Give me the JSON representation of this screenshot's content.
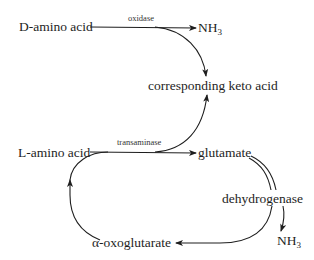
{
  "diagram": {
    "nodes": {
      "d_amino_acid": {
        "prefix": "D",
        "text": "-amino acid"
      },
      "nh3_top": {
        "base": "NH",
        "sub": "3"
      },
      "keto_acid": {
        "text": "corresponding keto acid"
      },
      "l_amino_acid": {
        "prefix": "L",
        "text": "-amino acid"
      },
      "glutamate": {
        "text": "glutamate"
      },
      "dehydrogenase": {
        "text": "dehydrogenase"
      },
      "nh3_bottom": {
        "base": "NH",
        "sub": "3"
      },
      "oxoglutarate": {
        "text": "α-oxoglutarate"
      }
    },
    "enzymes": {
      "oxidase": "oxidase",
      "transaminase": "transaminase"
    },
    "edges": [
      {
        "from": "D-amino acid",
        "to": "NH3",
        "label": "oxidase"
      },
      {
        "from": "D-amino acid",
        "to": "corresponding keto acid",
        "label": "oxidase"
      },
      {
        "from": "L-amino acid",
        "to": "glutamate",
        "label": "transaminase"
      },
      {
        "from": "L-amino acid",
        "to": "corresponding keto acid",
        "label": "transaminase"
      },
      {
        "from": "glutamate",
        "to": "α-oxoglutarate",
        "label": "dehydrogenase"
      },
      {
        "from": "glutamate",
        "to": "NH3",
        "label": "dehydrogenase"
      },
      {
        "from": "α-oxoglutarate",
        "to": "L-amino acid cycle",
        "label": ""
      }
    ]
  }
}
